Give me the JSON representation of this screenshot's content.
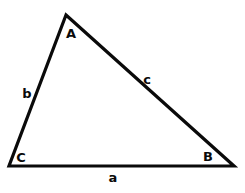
{
  "figure": {
    "kind": "geometry-diagram",
    "shape": "triangle",
    "background_color": "#ffffff",
    "stroke_color": "#0a0a0a",
    "label_color": "#0a0a0a",
    "stroke_width": 3.2
  },
  "vertices": [
    {
      "id": "A",
      "label": "A",
      "x": 66,
      "y": 15,
      "label_x": 71,
      "label_y": 33
    },
    {
      "id": "B",
      "label": "B",
      "x": 234,
      "y": 166,
      "label_x": 208,
      "label_y": 156
    },
    {
      "id": "C",
      "label": "C",
      "x": 9,
      "y": 166,
      "label_x": 21,
      "label_y": 157
    }
  ],
  "sides": [
    {
      "id": "a",
      "label": "a",
      "from": "C",
      "to": "B",
      "label_x": 113,
      "label_y": 177
    },
    {
      "id": "b",
      "label": "b",
      "from": "C",
      "to": "A",
      "label_x": 27,
      "label_y": 93
    },
    {
      "id": "c",
      "label": "c",
      "from": "A",
      "to": "B",
      "label_x": 147,
      "label_y": 79
    }
  ]
}
